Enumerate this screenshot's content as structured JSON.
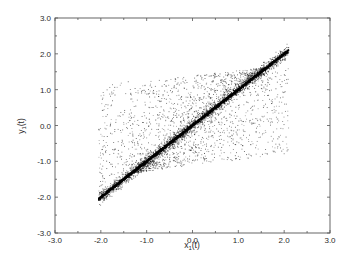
{
  "chart_data": {
    "type": "scatter",
    "title": "",
    "xlabel": "x1(t)",
    "ylabel": "y1(t)",
    "xlabel_main": "x",
    "xlabel_sub": "1",
    "xlabel_suffix": "(t)",
    "ylabel_main": "y",
    "ylabel_sub": "1",
    "ylabel_suffix": "(t)",
    "xlim": [
      -3.0,
      3.0
    ],
    "ylim": [
      -3.0,
      3.0
    ],
    "x_ticks": [
      "-3.0",
      "-2.0",
      "-1.0",
      "0.0",
      "1.0",
      "2.0",
      "3.0"
    ],
    "y_ticks": [
      "-3.0",
      "-2.0",
      "-1.0",
      "0.0",
      "1.0",
      "2.0",
      "3.0"
    ],
    "minor_tick_step": 0.5,
    "grid": false,
    "legend": null,
    "series": [
      {
        "name": "synchronized points (dense diagonal y = x)",
        "color": "#111111",
        "description": "dense cluster lying along y = x from about (-2.05, -2.05) to (2.1, 2.1)",
        "start": [
          -2.05,
          -2.05
        ],
        "end": [
          2.1,
          2.1
        ],
        "sample": [
          [
            -2.0,
            -2.0
          ],
          [
            -1.5,
            -1.5
          ],
          [
            -1.0,
            -1.0
          ],
          [
            -0.5,
            -0.5
          ],
          [
            0.0,
            0.0
          ],
          [
            0.5,
            0.5
          ],
          [
            1.0,
            1.0
          ],
          [
            1.5,
            1.5
          ],
          [
            2.0,
            2.0
          ]
        ]
      },
      {
        "name": "scattered points (off-diagonal cloud)",
        "color": "#555555",
        "description": "sparse cloud forming a parallelogram band around the diagonal: upper-left lobe x in [-2, 0.5], y up to ~1.2; lower-right lobe x in [-0.5, 2], y down to ~-1.1",
        "envelope": [
          [
            -2.05,
            -2.05
          ],
          [
            -2.0,
            0.8
          ],
          [
            0.5,
            1.25
          ],
          [
            2.1,
            2.1
          ],
          [
            2.0,
            -0.6
          ],
          [
            -0.5,
            -1.15
          ]
        ],
        "sample": [
          [
            -1.8,
            0.6
          ],
          [
            -1.4,
            0.9
          ],
          [
            -1.0,
            1.0
          ],
          [
            -0.6,
            1.1
          ],
          [
            -0.2,
            1.15
          ],
          [
            0.3,
            1.2
          ],
          [
            -1.6,
            -0.4
          ],
          [
            -1.0,
            0.2
          ],
          [
            -0.4,
            0.5
          ],
          [
            0.2,
            -0.9
          ],
          [
            0.6,
            -1.0
          ],
          [
            1.0,
            -0.8
          ],
          [
            1.4,
            -0.6
          ],
          [
            1.8,
            -0.2
          ],
          [
            1.9,
            0.6
          ],
          [
            0.8,
            -0.3
          ],
          [
            1.3,
            0.1
          ]
        ]
      }
    ]
  }
}
